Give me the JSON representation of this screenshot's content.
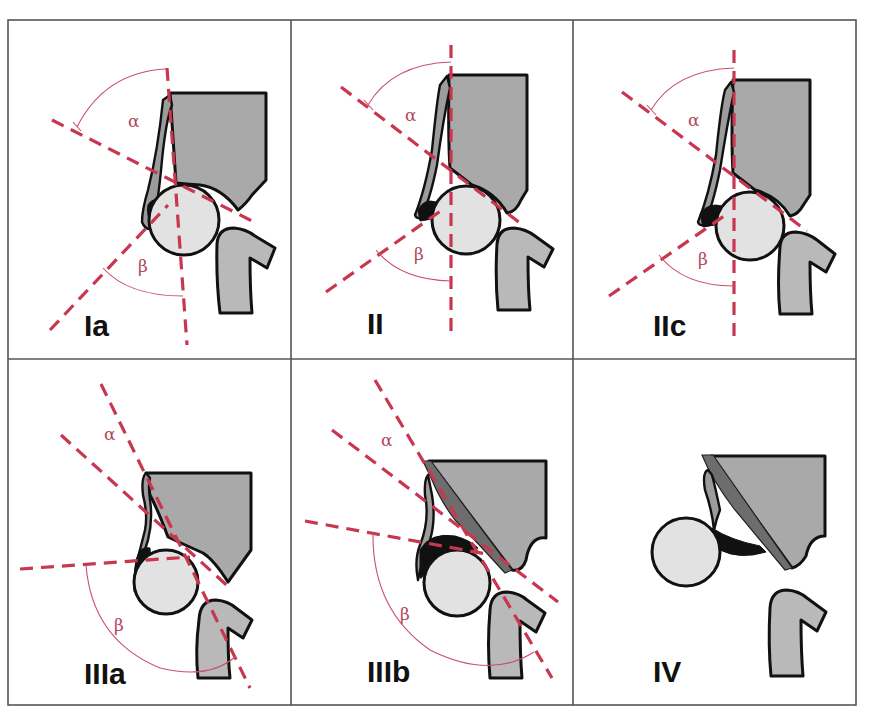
{
  "figure": {
    "title": "",
    "layout": {
      "rows": 2,
      "columns": 3
    },
    "colors": {
      "measurement_lines": "#c8364f",
      "angle_arcs": "#c8506a",
      "greek_labels": "#b2455e",
      "bone_fill": "#a9a9a9",
      "femoral_head_fill": "#e2e2e2",
      "outline": "#111111",
      "grid_lines": "#555555",
      "background": "#ffffff"
    },
    "angle_symbols": {
      "alpha": "α",
      "beta": "β"
    },
    "panels": [
      {
        "id": "Ia",
        "label": "Ia",
        "row": 1,
        "col": 1,
        "shows_alpha": true,
        "shows_beta": true
      },
      {
        "id": "II",
        "label": "II",
        "row": 1,
        "col": 2,
        "shows_alpha": true,
        "shows_beta": true
      },
      {
        "id": "IIc",
        "label": "IIc",
        "row": 1,
        "col": 3,
        "shows_alpha": true,
        "shows_beta": true
      },
      {
        "id": "IIIa",
        "label": "IIIa",
        "row": 2,
        "col": 1,
        "shows_alpha": true,
        "shows_beta": true
      },
      {
        "id": "IIIb",
        "label": "IIIb",
        "row": 2,
        "col": 2,
        "shows_alpha": true,
        "shows_beta": true
      },
      {
        "id": "IV",
        "label": "IV",
        "row": 2,
        "col": 3,
        "shows_alpha": false,
        "shows_beta": false
      }
    ]
  }
}
